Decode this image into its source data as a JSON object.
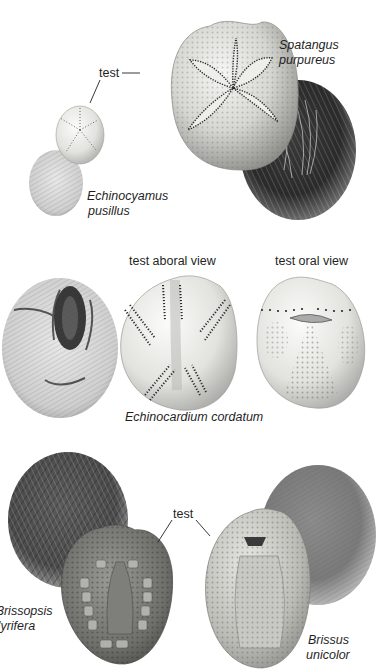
{
  "figure": {
    "background": "#ffffff",
    "ink_color": "#1f1f1f"
  },
  "panels": [
    {
      "id": "top",
      "specimens": [
        {
          "name": "Echinocyamus pusillus",
          "line1": "Echinocyamus",
          "line2": "pusillus",
          "views": [
            "test",
            "live animal with spines"
          ]
        },
        {
          "name": "Spatangus purpureus",
          "line1": "Spatangus",
          "line2": "purpureus",
          "views": [
            "test",
            "live animal with spines"
          ]
        }
      ],
      "labels": {
        "test": "test"
      }
    },
    {
      "id": "middle",
      "specimens": [
        {
          "name": "Echinocardium cordatum",
          "line1": "Echinocardium cordatum",
          "views": [
            "live animal with spines",
            "test aboral view",
            "test oral view"
          ]
        }
      ],
      "labels": {
        "aboral": "test aboral view",
        "oral": "test oral view"
      }
    },
    {
      "id": "bottom",
      "specimens": [
        {
          "name": "Brissopsis lyrifera",
          "line1": "Brissopsis",
          "line2": "lyrifera",
          "visible_line1": "3rissopsis",
          "visible_line2": "'yrifera",
          "views": [
            "live animal with spines",
            "test"
          ]
        },
        {
          "name": "Brissus unicolor",
          "line1": "Brissus",
          "line2": "unicolor",
          "views": [
            "test",
            "live animal with spines"
          ]
        }
      ],
      "labels": {
        "test": "test"
      }
    }
  ]
}
